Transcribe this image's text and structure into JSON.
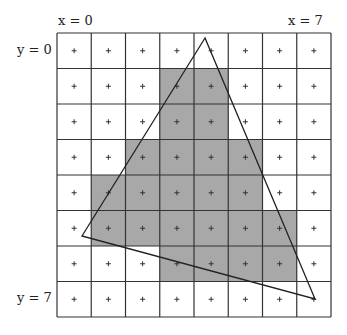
{
  "labels": {
    "x_start": "x = 0",
    "x_end": "x = 7",
    "y_start": "y = 0",
    "y_end": "y = 7"
  },
  "grid": {
    "cols": 8,
    "rows": 8,
    "sample_marker": "+",
    "shade_color": "#a8a8a8",
    "line_color": "#333333"
  },
  "shaded_cells": [
    [
      1,
      3
    ],
    [
      1,
      4
    ],
    [
      2,
      3
    ],
    [
      2,
      4
    ],
    [
      3,
      2
    ],
    [
      3,
      3
    ],
    [
      3,
      4
    ],
    [
      3,
      5
    ],
    [
      4,
      1
    ],
    [
      4,
      2
    ],
    [
      4,
      3
    ],
    [
      4,
      4
    ],
    [
      4,
      5
    ],
    [
      5,
      1
    ],
    [
      5,
      2
    ],
    [
      5,
      3
    ],
    [
      5,
      4
    ],
    [
      5,
      5
    ],
    [
      5,
      6
    ],
    [
      6,
      3
    ],
    [
      6,
      4
    ],
    [
      6,
      5
    ],
    [
      6,
      6
    ]
  ],
  "triangle": {
    "vertices_px": [
      [
        205,
        38
      ],
      [
        82,
        236
      ],
      [
        315,
        299
      ]
    ]
  }
}
